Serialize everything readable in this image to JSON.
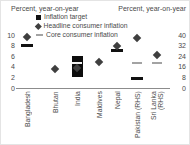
{
  "chart_data": {
    "type": "scatter",
    "title": "",
    "left_axis": {
      "label": "Percent, year-on-year",
      "ticks": [
        0,
        2,
        4,
        6,
        8,
        10
      ],
      "range": [
        0,
        10
      ]
    },
    "right_axis": {
      "label": "Percent, year-on-year",
      "ticks": [
        0,
        8,
        16,
        24,
        32,
        40
      ],
      "range": [
        0,
        40
      ]
    },
    "legend": [
      {
        "marker": "square",
        "series": "inflation_target",
        "label": "Inflation target"
      },
      {
        "marker": "diamond",
        "series": "headline",
        "label": "Headline consumer inflation"
      },
      {
        "marker": "dash",
        "series": "core",
        "label": "Core consumer inflation"
      }
    ],
    "colors": {
      "inflation_target": "#111111",
      "target_band": "#0d0d0d",
      "headline": "#3f3f3f",
      "core": "#a3a3a3",
      "core_on_band": "#f2f2f2",
      "axis_line": "#8c8c8c",
      "text": "#4a4a4a"
    },
    "categories": [
      {
        "label": "Bangladesh",
        "axis": "left",
        "inflation_target": 8,
        "headline": 9.7
      },
      {
        "label": "Bhutan",
        "axis": "left",
        "headline": 3.6
      },
      {
        "label": "India",
        "axis": "left",
        "target_band": [
          2,
          6
        ],
        "headline": 3.8,
        "core": 4.7
      },
      {
        "label": "Maldives",
        "axis": "left",
        "headline": 5
      },
      {
        "label": "Nepal",
        "axis": "left",
        "inflation_target": 7,
        "headline": 8
      },
      {
        "label": "Pakistan (RHS)",
        "axis": "right",
        "inflation_target": 7,
        "headline": 38,
        "core": 19
      },
      {
        "label": "Sri Lanka (RHS)",
        "axis": "right",
        "headline": 25,
        "core": 19
      }
    ],
    "layout": {
      "grid": false,
      "legend_position": "top",
      "rhs_to_lhs_ratio": 4,
      "x_centers_px": [
        27,
        55,
        77,
        99,
        117,
        137,
        157
      ],
      "baseline_y_px": 88,
      "px_per_left_unit": 5.3,
      "legend_top_px": 13,
      "legend_row_h_px": 9,
      "xlabel_top_px": 91
    }
  }
}
